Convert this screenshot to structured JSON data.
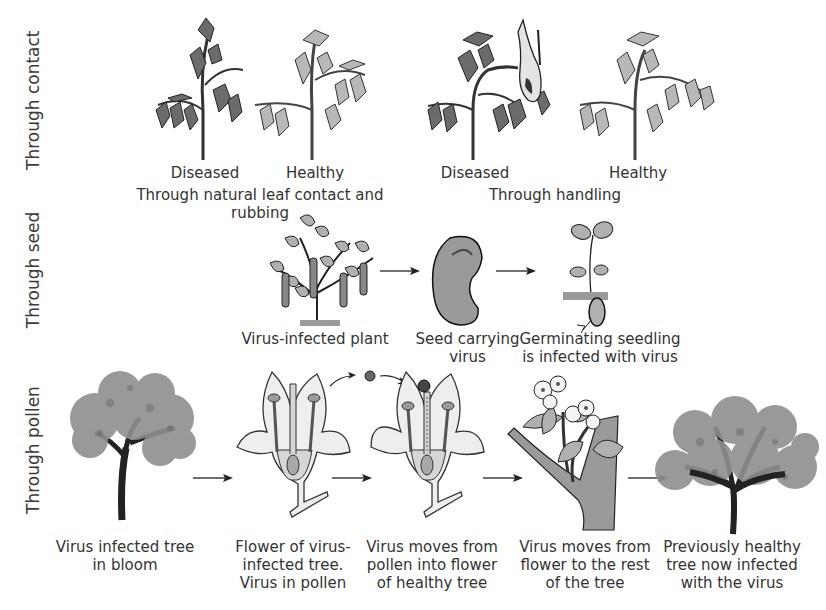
{
  "rows": {
    "contact": {
      "side_label": "Through contact",
      "groups": [
        {
          "caption": "Through natural leaf contact and rubbing",
          "plants": [
            {
              "label": "Diseased",
              "state": "diseased",
              "icon": "tomato-plant-icon"
            },
            {
              "label": "Healthy",
              "state": "healthy",
              "icon": "tomato-plant-icon"
            }
          ]
        },
        {
          "caption": "Through handling",
          "plants": [
            {
              "label": "Diseased",
              "state": "diseased",
              "icon": "tomato-plant-with-hand-icon"
            },
            {
              "label": "Healthy",
              "state": "healthy",
              "icon": "tomato-plant-icon"
            }
          ]
        }
      ]
    },
    "seed": {
      "side_label": "Through seed",
      "steps": [
        {
          "label": "Virus-infected plant",
          "icon": "bean-plant-icon"
        },
        {
          "label": "Seed carrying\nvirus",
          "icon": "bean-seed-icon"
        },
        {
          "label": "Germinating seedling\nis infected with virus",
          "icon": "seedling-icon"
        }
      ]
    },
    "pollen": {
      "side_label": "Through pollen",
      "steps": [
        {
          "label": "Virus infected tree\nin bloom",
          "icon": "tree-icon"
        },
        {
          "label": "Flower of virus-\ninfected tree.\nVirus in pollen",
          "icon": "flower-cross-section-icon"
        },
        {
          "label": "Virus moves from\npollen into flower\nof healthy tree",
          "icon": "flower-cross-section-pollinated-icon"
        },
        {
          "label": "Virus moves from\nflower to the rest\nof the tree",
          "icon": "branch-with-blossoms-icon"
        },
        {
          "label": "Previously healthy\ntree now infected\nwith the virus",
          "icon": "large-tree-icon"
        }
      ]
    }
  },
  "colors": {
    "background": "#ffffff",
    "text": "#333333",
    "ink": "#222222",
    "leaf_diseased": "#6b6b6b",
    "leaf_healthy": "#b8b8b8",
    "petal": "#eeeeee",
    "foliage": "#8f8f8f"
  }
}
